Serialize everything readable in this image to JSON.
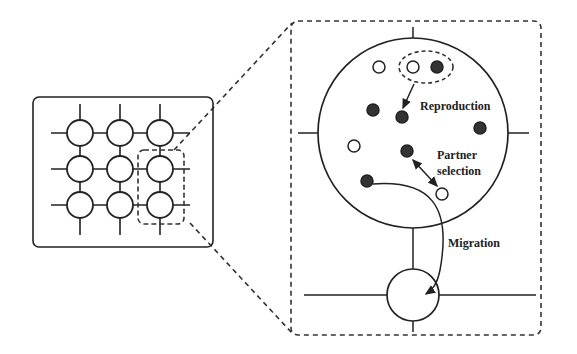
{
  "diagram": {
    "labels": {
      "reproduction": "Reproduction",
      "partner_line1": "Partner",
      "partner_line2": "selection",
      "migration": "Migration"
    },
    "grid": {
      "rows": 3,
      "cols": 3,
      "highlighted_column": 3,
      "highlighted_rows": [
        2,
        3
      ]
    },
    "individuals": [
      {
        "x": 379,
        "y": 67,
        "type": "hollow"
      },
      {
        "x": 413,
        "y": 67,
        "type": "hollow"
      },
      {
        "x": 437,
        "y": 67,
        "type": "filled"
      },
      {
        "x": 373,
        "y": 110,
        "type": "filled"
      },
      {
        "x": 401,
        "y": 116,
        "type": "filled"
      },
      {
        "x": 480,
        "y": 128,
        "type": "filled"
      },
      {
        "x": 354,
        "y": 146,
        "type": "hollow"
      },
      {
        "x": 407,
        "y": 151,
        "type": "filled"
      },
      {
        "x": 367,
        "y": 180,
        "type": "filled"
      },
      {
        "x": 442,
        "y": 193,
        "type": "hollow"
      }
    ],
    "colors": {
      "stroke": "#222222",
      "fill_dark": "#333333",
      "background": "#ffffff"
    }
  }
}
